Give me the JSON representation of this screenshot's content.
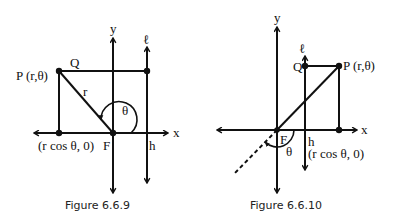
{
  "figures": [
    {
      "id": "fig-6-6-9",
      "caption": "Figure 6.6.9",
      "labels": {
        "y_axis": "y",
        "x_axis": "x",
        "directrix": "ℓ",
        "point_p": "P (r,θ)",
        "point_q": "Q",
        "radius": "r",
        "angle": "θ",
        "focus": "F",
        "foot": "(r cos θ, 0)",
        "h": "h"
      }
    },
    {
      "id": "fig-6-6-10",
      "caption": "Figure 6.6.10",
      "labels": {
        "y_axis": "y",
        "x_axis": "x",
        "directrix": "ℓ",
        "point_p": "P (r,θ)",
        "point_q": "Q",
        "angle": "θ",
        "focus": "F",
        "foot": "(r cos θ, 0)",
        "h": "h"
      }
    }
  ]
}
